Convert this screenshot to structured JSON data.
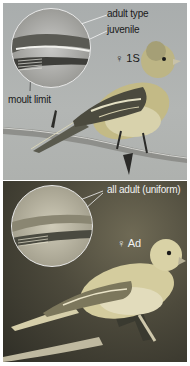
{
  "figure": {
    "top_panel": {
      "sex_age_label": "♀ 1S",
      "callouts": {
        "adult_type": "adult type",
        "juvenile": "juvenile",
        "moult_limit": "moult limit"
      },
      "colors": {
        "background": "#adb0ae",
        "bird_body": "#c9c08a",
        "wing": "#4a4a3e",
        "branch": "#8c8c88"
      }
    },
    "bottom_panel": {
      "sex_age_label": "♀ Ad",
      "callouts": {
        "all_adult": "all adult (uniform)"
      },
      "colors": {
        "background": "#4d4a3c",
        "bird_body": "#d8d0a6",
        "wing": "#6a6650",
        "perch": "#c4bfa8"
      }
    }
  }
}
